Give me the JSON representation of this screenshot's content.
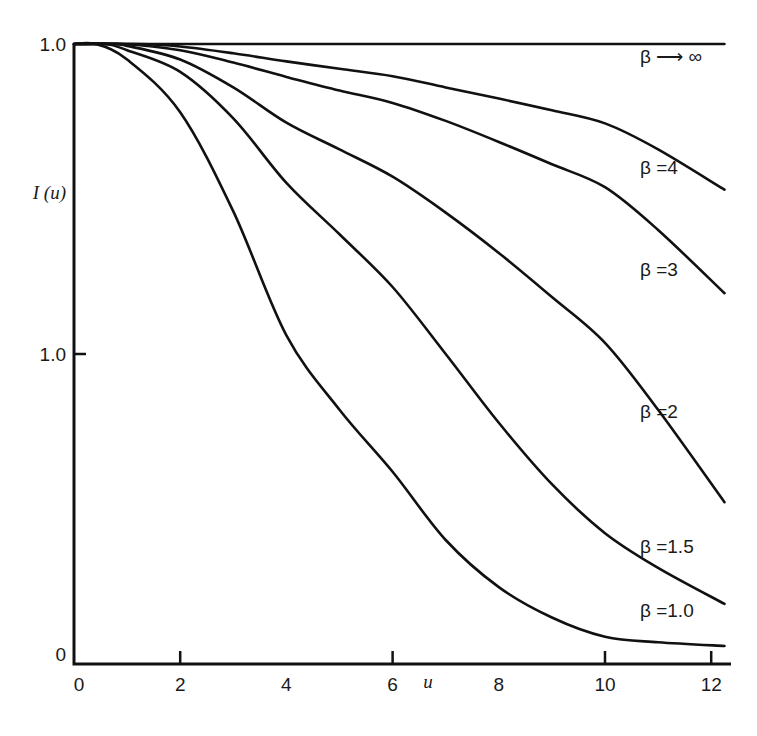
{
  "chart_data": {
    "type": "line",
    "title": "",
    "xlabel": "u",
    "ylabel": "I (u)",
    "xlim": [
      0,
      12.4
    ],
    "ylim": [
      0,
      1.0
    ],
    "grid": false,
    "legend": "inline labels at right end of each curve",
    "x_ticks": [
      {
        "value": 0,
        "label": "0",
        "mark": false
      },
      {
        "value": 2,
        "label": "2",
        "mark": true
      },
      {
        "value": 4,
        "label": "4",
        "mark": false
      },
      {
        "value": 6,
        "label": "6",
        "mark": true
      },
      {
        "value": 8,
        "label": "8",
        "mark": false
      },
      {
        "value": 10,
        "label": "10",
        "mark": true
      },
      {
        "value": 12,
        "label": "12",
        "mark": true
      }
    ],
    "y_ticks": [
      {
        "value": 0,
        "label": "0",
        "mark": false
      },
      {
        "value": 0.5,
        "label": "1.0",
        "mark": true
      },
      {
        "value": 1.0,
        "label": "1.0",
        "mark": false
      }
    ],
    "series": [
      {
        "name": "β→∞",
        "label": "β ⟶ ∞",
        "x": [
          0,
          12.25
        ],
        "y": [
          1.0,
          1.0
        ]
      },
      {
        "name": "β=4",
        "label": "β =4",
        "x": [
          0,
          1.2,
          2,
          3,
          4,
          5,
          6,
          7,
          8,
          9,
          10,
          11,
          12.25
        ],
        "y": [
          1.0,
          1.0,
          0.996,
          0.985,
          0.972,
          0.96,
          0.948,
          0.93,
          0.912,
          0.893,
          0.872,
          0.83,
          0.765
        ]
      },
      {
        "name": "β=3",
        "label": "β =3",
        "x": [
          0,
          0.9,
          2,
          3,
          4,
          5,
          6,
          7,
          8,
          9,
          10,
          11,
          12.25
        ],
        "y": [
          1.0,
          1.0,
          0.99,
          0.97,
          0.947,
          0.925,
          0.905,
          0.876,
          0.842,
          0.806,
          0.769,
          0.7,
          0.598
        ]
      },
      {
        "name": "β=2",
        "label": "β =2",
        "x": [
          0,
          0.7,
          1,
          2,
          3,
          4,
          5,
          6,
          7,
          8,
          9,
          10,
          11,
          12.25
        ],
        "y": [
          1.0,
          1.0,
          0.997,
          0.975,
          0.93,
          0.873,
          0.83,
          0.786,
          0.728,
          0.663,
          0.592,
          0.518,
          0.41,
          0.261
        ]
      },
      {
        "name": "β=1.5",
        "label": "β =1.5",
        "x": [
          0,
          0.6,
          1,
          2,
          3,
          4,
          5,
          6,
          7,
          8,
          9,
          10,
          11,
          12.25
        ],
        "y": [
          1.0,
          1.0,
          0.99,
          0.955,
          0.88,
          0.776,
          0.693,
          0.608,
          0.5,
          0.389,
          0.29,
          0.211,
          0.155,
          0.097
        ]
      },
      {
        "name": "β=1.0",
        "label": "β =1.0",
        "x": [
          0,
          0.4,
          1,
          2,
          3,
          4,
          5,
          6,
          7,
          8,
          9,
          10,
          11,
          12.25
        ],
        "y": [
          1.0,
          1.0,
          0.975,
          0.89,
          0.73,
          0.53,
          0.41,
          0.31,
          0.2,
          0.124,
          0.075,
          0.044,
          0.035,
          0.029
        ]
      }
    ]
  }
}
